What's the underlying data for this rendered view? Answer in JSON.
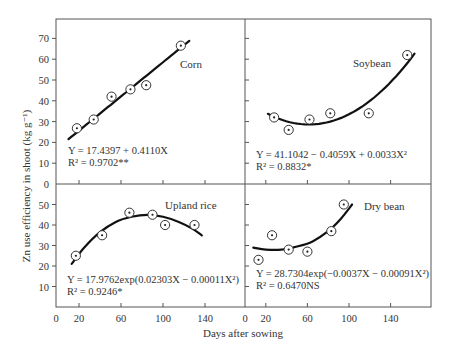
{
  "chart_data": {
    "type": "scatter",
    "layout": "2x2 panels with shared axes",
    "xlabel": "Days after sowing",
    "ylabel": "Zn use efficiency in shoot (kg g⁻¹)",
    "grid": false,
    "legend": "none (panel labels inside each panel)",
    "x_ticks": [
      0,
      20,
      60,
      100,
      140
    ],
    "xlim": [
      0,
      180
    ],
    "y_ticks_top": [
      10,
      20,
      30,
      40,
      50,
      60,
      70
    ],
    "y_ticks_bottom": [
      0,
      10,
      20,
      30,
      40,
      50
    ],
    "ylim_top": [
      0,
      70
    ],
    "ylim_bottom": [
      0,
      50
    ],
    "panels": [
      {
        "name": "Corn",
        "position": "top-left",
        "x": [
          18,
          34,
          51,
          69,
          84,
          117
        ],
        "y": [
          26.8,
          31,
          42,
          45.5,
          47.5,
          66.5
        ],
        "fit_type": "linear",
        "fit_range": [
          10,
          125
        ],
        "fit": {
          "a": 17.4397,
          "b": 0.411
        },
        "equation": "Y = 17.4397 + 0.4110X",
        "r2": "R² = 0.9702**"
      },
      {
        "name": "Soybean",
        "position": "top-right",
        "x": [
          28,
          42,
          62,
          82,
          119,
          156
        ],
        "y": [
          32,
          26,
          31,
          34,
          34,
          62
        ],
        "fit_type": "quadratic",
        "fit_range": [
          22,
          163
        ],
        "fit": {
          "a": 41.1042,
          "b": -0.4059,
          "c": 0.0033
        },
        "equation": "Y = 41.1042 − 0.4059X + 0.0033X²",
        "r2": "R² = 0.8832*"
      },
      {
        "name": "Upland rice",
        "position": "bottom-left",
        "x": [
          17,
          42,
          68,
          90,
          102,
          130
        ],
        "y": [
          25,
          35,
          46,
          45,
          40,
          40
        ],
        "fit_type": "exp-quadratic",
        "fit_range": [
          13,
          137
        ],
        "fit": {
          "a": 17.9762,
          "b": 0.02303,
          "c": -0.00011
        },
        "equation": "Y = 17.9762exp(0.02303X − 0.00011X²)",
        "r2": "R² = 0.9246*"
      },
      {
        "name": "Dry bean",
        "position": "bottom-right",
        "x": [
          13,
          26,
          42,
          60,
          83,
          95
        ],
        "y": [
          23,
          35,
          28,
          27,
          37,
          50
        ],
        "fit_type": "exp-quadratic",
        "fit_range": [
          8,
          103
        ],
        "fit": {
          "a": 28.7304,
          "b": -0.0037,
          "c": 0.00091
        },
        "equation": "Y = 28.7304exp(−0.0037X − 0.00091X²)",
        "r2": "R² = 0.6470NS"
      }
    ]
  },
  "labels": {
    "xlabel": "Days after sowing",
    "ylabel": "Zn use efficiency in shoot (kg g⁻¹)",
    "corn": "Corn",
    "soybean": "Soybean",
    "upland_rice": "Upland rice",
    "dry_bean": "Dry bean",
    "corn_eq": "Y = 17.4397 + 0.4110X",
    "corn_r2": "R² = 0.9702**",
    "soy_eq": "Y = 41.1042 − 0.4059X + 0.0033X²",
    "soy_r2": "R² = 0.8832*",
    "rice_eq": "Y = 17.9762exp(0.02303X − 0.00011X²)",
    "rice_r2": "R² = 0.9246*",
    "bean_eq": "Y = 28.7304exp(−0.0037X − 0.00091X²)",
    "bean_r2": "R² = 0.6470NS"
  }
}
